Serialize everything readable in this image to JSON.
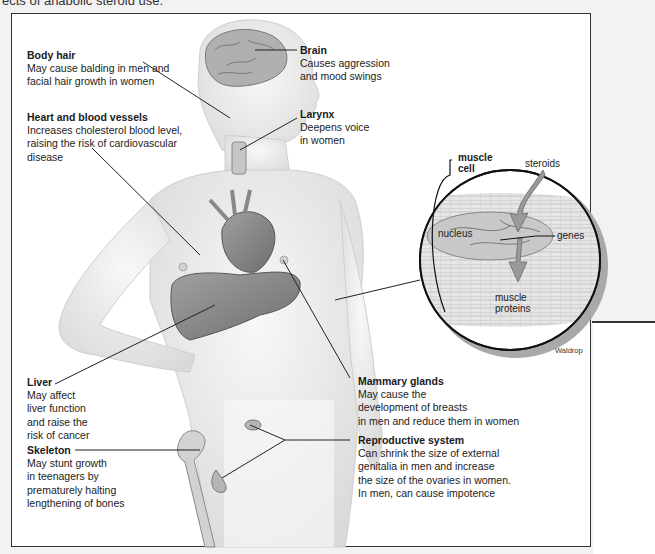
{
  "caption_top": "ects of anabolic steroid use.",
  "labels": {
    "body_hair": {
      "title": "Body hair",
      "lines": [
        "May cause balding in men and",
        "facial hair growth in women"
      ]
    },
    "heart": {
      "title": "Heart and blood vessels",
      "lines": [
        "Increases cholesterol blood level,",
        "raising the risk of cardiovascular",
        "disease"
      ]
    },
    "brain": {
      "title": "Brain",
      "lines": [
        "Causes aggression",
        "and mood swings"
      ]
    },
    "larynx": {
      "title": "Larynx",
      "lines": [
        "Deepens voice",
        "in women"
      ]
    },
    "liver": {
      "title": "Liver",
      "lines": [
        "May affect",
        "liver function",
        "and raise the",
        "risk of cancer"
      ]
    },
    "skeleton": {
      "title": "Skeleton",
      "lines": [
        "May stunt growth",
        "in teenagers by",
        "prematurely halting",
        "lengthening of bones"
      ]
    },
    "mammary": {
      "title": "Mammary glands",
      "lines": [
        "May cause the",
        "development of breasts",
        "in men and reduce them in women"
      ]
    },
    "reproductive": {
      "title": "Reproductive system",
      "lines": [
        "Can shrink the size of external",
        "genitalia in men and increase",
        "the size of the ovaries in women.",
        "In men, can cause impotence"
      ]
    }
  },
  "inset": {
    "muscle_cell": [
      "muscle",
      "cell"
    ],
    "steroids": "steroids",
    "nucleus": "nucleus",
    "genes": "genes",
    "muscle_proteins": [
      "muscle",
      "proteins"
    ]
  },
  "credit": "Waldrop",
  "colors": {
    "frame": "#333333",
    "body": "#ececec",
    "organ": "#8a8a8a",
    "inset_shadow": "#a9a9a9"
  }
}
